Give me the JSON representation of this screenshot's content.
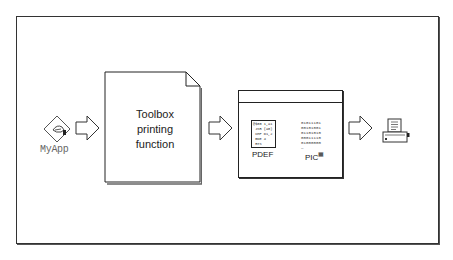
{
  "diagram": {
    "nodes": [
      {
        "id": "myapp",
        "label": "MyApp",
        "icon": "application-icon"
      },
      {
        "id": "toolbox",
        "label_lines": [
          "Toolbox",
          "printing",
          "function"
        ],
        "icon": "document-page"
      },
      {
        "id": "printer-resource",
        "icon": "window",
        "items": [
          {
            "label": "PDEF",
            "code_lines": [
              "@$00 1,a1",
              " JSR (a0)",
              " CMP D1,2",
              " BNE 4",
              " RTS"
            ]
          },
          {
            "label": "PIC",
            "bits": [
              "01011101",
              "00101001",
              "01101010",
              "00011110",
              "01000000",
              "—"
            ]
          }
        ]
      },
      {
        "id": "printer",
        "icon": "printer-icon"
      }
    ],
    "edges": [
      {
        "from": "myapp",
        "to": "toolbox"
      },
      {
        "from": "toolbox",
        "to": "printer-resource"
      },
      {
        "from": "printer-resource",
        "to": "printer"
      }
    ]
  },
  "labels": {
    "myapp": "MyApp",
    "toolbox": "Toolbox\nprinting\nfunction",
    "pdef": "PDEF",
    "pic": "PIC",
    "pdef_code": "@$00 1,a1\n JSR (a0)\n CMP D1,2\n BNE 4\n RTS",
    "pic_bits": "01011101\n00101001\n01101010\n00011110\n01000000\n—"
  }
}
